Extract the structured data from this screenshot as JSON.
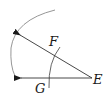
{
  "diagram": {
    "labels": {
      "E": "E",
      "F": "F",
      "G": "G"
    },
    "colors": {
      "ray": "#333333",
      "large_arc": "#8a8a8a",
      "small_arc": "#555555"
    }
  }
}
